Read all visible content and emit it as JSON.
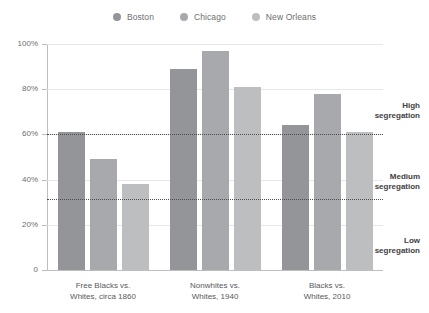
{
  "legend": {
    "items": [
      {
        "label": "Boston",
        "color": "#939598",
        "icon": "legend-dot-icon"
      },
      {
        "label": "Chicago",
        "color": "#a7a9ac",
        "icon": "legend-dot-icon"
      },
      {
        "label": "New Orleans",
        "color": "#bcbec0",
        "icon": "legend-dot-icon"
      }
    ]
  },
  "axis": {
    "y_ticks": [
      "100%",
      "80%",
      "60%",
      "40%",
      "20%",
      "0"
    ]
  },
  "annotations": [
    {
      "line1": "High",
      "line2": "segregation"
    },
    {
      "line1": "Medium",
      "line2": "segregation"
    },
    {
      "line1": "Low",
      "line2": "segregation"
    }
  ],
  "groups": [
    {
      "line1": "Free Blacks vs.",
      "line2": "Whites, circa 1860"
    },
    {
      "line1": "Nonwhites vs.",
      "line2": "Whites, 1940"
    },
    {
      "line1": "Blacks vs.",
      "line2": "Whites, 2010"
    }
  ],
  "chart_data": {
    "type": "bar",
    "title": "",
    "subtitle": "",
    "xlabel": "",
    "ylabel": "",
    "ylim": [
      0,
      100
    ],
    "grid": true,
    "legend_position": "top-center",
    "categories": [
      "Free Blacks vs. Whites, circa 1860",
      "Nonwhites vs. Whites, 1940",
      "Blacks vs. Whites, 2010"
    ],
    "series": [
      {
        "name": "Boston",
        "color": "#939598",
        "values": [
          61,
          89,
          64
        ]
      },
      {
        "name": "Chicago",
        "color": "#a7a9ac",
        "values": [
          49,
          97,
          78
        ]
      },
      {
        "name": "New Orleans",
        "color": "#bcbec0",
        "values": [
          38,
          81,
          61
        ]
      }
    ],
    "y_tick_values": [
      0,
      20,
      40,
      60,
      80,
      100
    ],
    "y_tick_labels": [
      "0",
      "20%",
      "40%",
      "60%",
      "80%",
      "100%"
    ],
    "threshold_lines": [
      {
        "label": "High segregation",
        "value": 60
      },
      {
        "label": "Medium segregation",
        "value": 31.5
      }
    ],
    "zone_labels": [
      "High segregation",
      "Medium segregation",
      "Low segregation"
    ]
  }
}
